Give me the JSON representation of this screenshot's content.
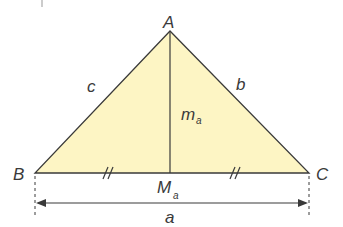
{
  "diagram": {
    "fill_color": "#fdf5c4",
    "stroke_color": "#3a3a3a",
    "vertices": {
      "A": {
        "label": "A",
        "x": 170,
        "y": 31
      },
      "B": {
        "label": "B",
        "x": 35,
        "y": 173
      },
      "C": {
        "label": "C",
        "x": 309,
        "y": 173
      },
      "M": {
        "label": "M",
        "sub": "a",
        "x": 170,
        "y": 173
      }
    },
    "sides": {
      "a": "a",
      "b": "b",
      "c": "c"
    },
    "median": {
      "label": "m",
      "sub": "a"
    },
    "tick_marks": "//",
    "dimension_label": "a"
  }
}
